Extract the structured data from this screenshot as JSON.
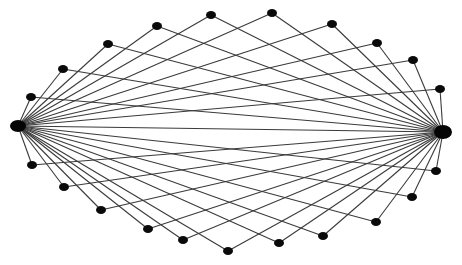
{
  "diagram": {
    "type": "graph",
    "width": 462,
    "height": 265,
    "colors": {
      "background": "#ffffff",
      "edge": "#3a3a3a",
      "node": "#0a0a0a"
    },
    "hubs": [
      {
        "id": "L",
        "x": 18,
        "y": 126,
        "rx": 8,
        "ry": 6
      },
      {
        "id": "R",
        "x": 443,
        "y": 132,
        "rx": 9,
        "ry": 7
      }
    ],
    "peripheral_nodes": {
      "top": [
        {
          "id": "t1",
          "x": 31,
          "y": 97
        },
        {
          "id": "t2",
          "x": 63,
          "y": 69
        },
        {
          "id": "t3",
          "x": 108,
          "y": 44
        },
        {
          "id": "t4",
          "x": 157,
          "y": 26
        },
        {
          "id": "t5",
          "x": 211,
          "y": 15
        },
        {
          "id": "t6",
          "x": 272,
          "y": 13
        },
        {
          "id": "t7",
          "x": 332,
          "y": 24
        },
        {
          "id": "t8",
          "x": 377,
          "y": 43
        },
        {
          "id": "t9",
          "x": 413,
          "y": 60
        },
        {
          "id": "t10",
          "x": 440,
          "y": 89
        }
      ],
      "bottom": [
        {
          "id": "b1",
          "x": 32,
          "y": 165
        },
        {
          "id": "b2",
          "x": 64,
          "y": 187
        },
        {
          "id": "b3",
          "x": 101,
          "y": 210
        },
        {
          "id": "b4",
          "x": 148,
          "y": 229
        },
        {
          "id": "b5",
          "x": 183,
          "y": 240
        },
        {
          "id": "b6",
          "x": 228,
          "y": 251
        },
        {
          "id": "b7",
          "x": 279,
          "y": 243
        },
        {
          "id": "b8",
          "x": 323,
          "y": 236
        },
        {
          "id": "b9",
          "x": 376,
          "y": 222
        },
        {
          "id": "b10",
          "x": 412,
          "y": 197
        },
        {
          "id": "b11",
          "x": 436,
          "y": 171
        }
      ]
    },
    "node_size": {
      "rx": 5,
      "ry": 4
    },
    "edges_rule": "each hub connects to every peripheral node; hubs connect to each other",
    "counts": {
      "hubs": 2,
      "peripheral": 21,
      "edges": 43
    }
  }
}
